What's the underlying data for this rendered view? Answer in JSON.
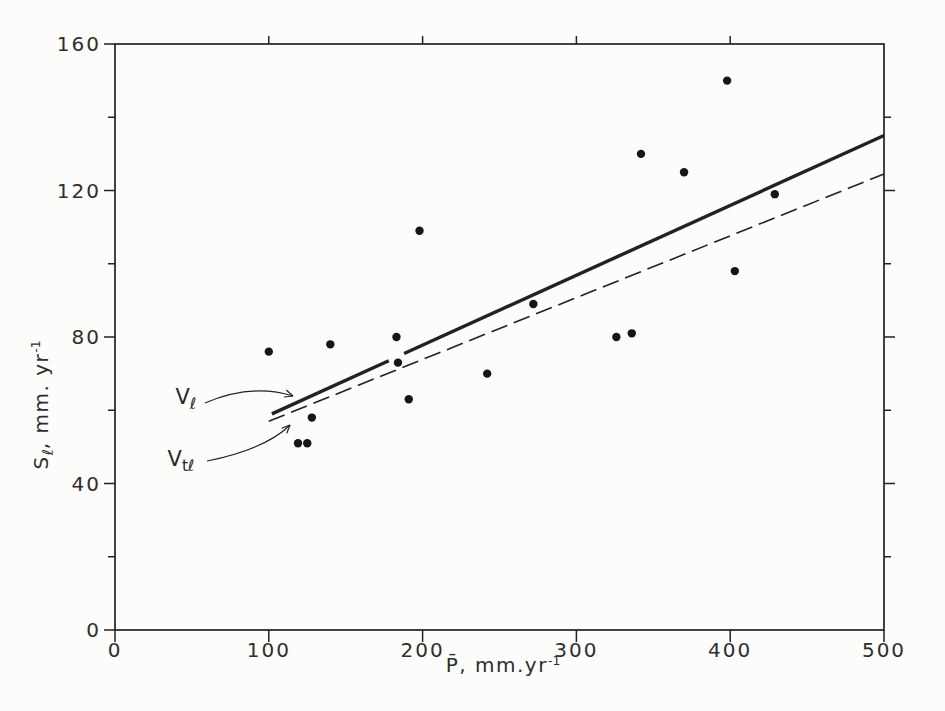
{
  "chart_data": {
    "type": "scatter",
    "title": "",
    "xlabel": {
      "main": "P̄",
      "rest": ", mm.yr",
      "sup": "-1"
    },
    "ylabel": {
      "main": "S",
      "sub": "ℓ",
      "rest": ", mm. yr",
      "sup": "-1"
    },
    "xlim": [
      0,
      500
    ],
    "ylim": [
      0,
      160
    ],
    "grid": "off",
    "x_major_ticks": [
      0,
      100,
      200,
      300,
      400,
      500
    ],
    "x_top_ticks": [
      100,
      200,
      300,
      400
    ],
    "y_major_ticks": [
      0,
      40,
      80,
      120,
      160
    ],
    "y_minor_ticks": [
      20,
      60,
      100,
      140
    ],
    "y_right_major_ticks": [
      40,
      80,
      120
    ],
    "y_right_minor_ticks": [
      20,
      60,
      100,
      140
    ],
    "points": [
      [
        100,
        76
      ],
      [
        119,
        51
      ],
      [
        125,
        51
      ],
      [
        128,
        58
      ],
      [
        140,
        78
      ],
      [
        183,
        80
      ],
      [
        184,
        73
      ],
      [
        191,
        63
      ],
      [
        198,
        109
      ],
      [
        242,
        70
      ],
      [
        272,
        89
      ],
      [
        326,
        80
      ],
      [
        336,
        81
      ],
      [
        342,
        130
      ],
      [
        370,
        125
      ],
      [
        398,
        150
      ],
      [
        403,
        98
      ],
      [
        429,
        119
      ]
    ],
    "lines": [
      {
        "name": "Vℓ regression line",
        "style": "solid",
        "segments": [
          [
            [
              102,
              59
            ],
            [
              178,
              73.5
            ]
          ],
          [
            [
              188,
              75.5
            ],
            [
              500,
              135
            ]
          ]
        ]
      },
      {
        "name": "Vtℓ regression line",
        "style": "dashed",
        "segments": [
          [
            [
              100,
              57
            ],
            [
              500,
              124.5
            ]
          ]
        ]
      }
    ],
    "annotations": [
      {
        "id": "vl",
        "label": {
          "main": "V",
          "sub": "ℓ"
        },
        "label_center_px": [
          186,
          399
        ],
        "arrow_px": {
          "from": [
            205,
            403
          ],
          "ctrl": [
            252,
            383
          ],
          "to": [
            293,
            396
          ]
        }
      },
      {
        "id": "vtl",
        "label": {
          "main": "V",
          "sub": "tℓ"
        },
        "label_center_px": [
          181,
          461
        ],
        "arrow_px": {
          "from": [
            207,
            461
          ],
          "ctrl": [
            266,
            449
          ],
          "to": [
            290,
            425
          ]
        }
      }
    ],
    "ink_color": "#222222",
    "point_color": "#161616",
    "background": "#fcfcfa"
  }
}
